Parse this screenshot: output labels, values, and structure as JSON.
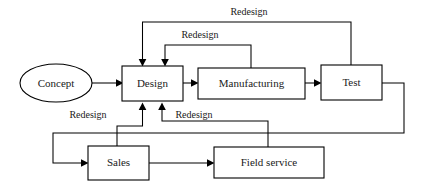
{
  "diagram": {
    "background_color": "#ffffff",
    "stroke_color": "#000000",
    "text_color": "#1a1a1a",
    "nodes": [
      {
        "id": "concept",
        "label": "Concept",
        "shape": "ellipse",
        "cx": 56,
        "cy": 83,
        "rx": 36,
        "ry": 19
      },
      {
        "id": "design",
        "label": "Design",
        "shape": "rect",
        "x": 122,
        "y": 66,
        "w": 61,
        "h": 35
      },
      {
        "id": "manufacturing",
        "label": "Manufacturing",
        "shape": "rect",
        "x": 198,
        "y": 68,
        "w": 107,
        "h": 31
      },
      {
        "id": "test",
        "label": "Test",
        "shape": "rect",
        "x": 321,
        "y": 65,
        "w": 61,
        "h": 35
      },
      {
        "id": "sales",
        "label": "Sales",
        "shape": "rect",
        "x": 88,
        "y": 146,
        "w": 61,
        "h": 34
      },
      {
        "id": "field_service",
        "label": "Field service",
        "shape": "rect",
        "x": 214,
        "y": 147,
        "w": 110,
        "h": 31
      }
    ],
    "edge_labels": [
      {
        "id": "redesign-test-to-design",
        "label": "Redesign",
        "x": 249,
        "y": 13
      },
      {
        "id": "redesign-manufacturing-to-design",
        "label": "Redesign",
        "x": 200,
        "y": 36
      },
      {
        "id": "redesign-sales-to-design",
        "label": "Redesign",
        "x": 88,
        "y": 116
      },
      {
        "id": "redesign-fieldservice-to-design",
        "label": "Redesign",
        "x": 194,
        "y": 116
      }
    ],
    "edges": [
      {
        "id": "concept-to-design",
        "from": "concept",
        "to": "design",
        "label": ""
      },
      {
        "id": "design-to-manufacturing",
        "from": "design",
        "to": "manufacturing",
        "label": ""
      },
      {
        "id": "manufacturing-to-test",
        "from": "manufacturing",
        "to": "test",
        "label": ""
      },
      {
        "id": "test-to-design",
        "from": "test",
        "to": "design",
        "label": "Redesign"
      },
      {
        "id": "manufacturing-to-design",
        "from": "manufacturing",
        "to": "design",
        "label": "Redesign"
      },
      {
        "id": "test-to-sales",
        "from": "test",
        "to": "sales",
        "label": ""
      },
      {
        "id": "sales-to-field-service",
        "from": "sales",
        "to": "field_service",
        "label": ""
      },
      {
        "id": "sales-to-design",
        "from": "sales",
        "to": "design",
        "label": "Redesign"
      },
      {
        "id": "field-service-to-design",
        "from": "field_service",
        "to": "design",
        "label": "Redesign"
      }
    ]
  }
}
